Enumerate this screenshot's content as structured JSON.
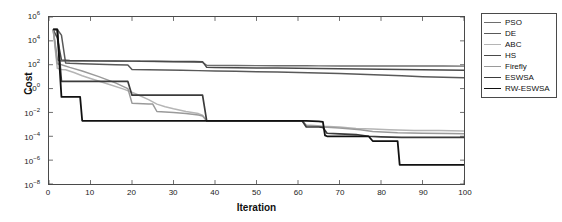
{
  "chart_data": {
    "type": "line",
    "title": "",
    "xlabel": "Iteration",
    "ylabel": "Cost",
    "xlim": [
      0,
      100
    ],
    "ylim": [
      1e-08,
      1000000.0
    ],
    "yscale": "log",
    "xscale": "linear",
    "grid": false,
    "legend_position": "top-right",
    "xticks": [
      "0",
      "10",
      "20",
      "30",
      "40",
      "50",
      "60",
      "70",
      "80",
      "90",
      "100"
    ],
    "xtick_values": [
      0,
      10,
      20,
      30,
      40,
      50,
      60,
      70,
      80,
      90,
      100
    ],
    "yticks": [
      "10−8",
      "10−6",
      "10−4",
      "10−2",
      "10⁰",
      "10²",
      "10⁴",
      "10⁶"
    ],
    "ytick_exponents": [
      -8,
      -6,
      -4,
      -2,
      0,
      2,
      4,
      6
    ],
    "series": [
      {
        "name": "PSO",
        "color": "#6e6e6e",
        "width": 1.5,
        "x": [
          1,
          2,
          3,
          4,
          5,
          8,
          12,
          16,
          20,
          21,
          22,
          26,
          30,
          34,
          37,
          38,
          40,
          45,
          50,
          55,
          60,
          62,
          65,
          70,
          75,
          80,
          85,
          90,
          95,
          100
        ],
        "y": [
          90000,
          260,
          200,
          200,
          200,
          200,
          200,
          200,
          200,
          200,
          195,
          190,
          180,
          170,
          160,
          90,
          88,
          86,
          84,
          83,
          82,
          81,
          80,
          79,
          79,
          78,
          78,
          77,
          77,
          76
        ]
      },
      {
        "name": "DE",
        "color": "#595959",
        "width": 1.5,
        "x": [
          1,
          2,
          3,
          4,
          5,
          8,
          12,
          16,
          19,
          20,
          24,
          28,
          32,
          36,
          40,
          45,
          50,
          55,
          60,
          65,
          70,
          75,
          80,
          85,
          90,
          95,
          100
        ],
        "y": [
          90000,
          90000,
          30000,
          140,
          130,
          120,
          110,
          100,
          95,
          40,
          38,
          36,
          34,
          32,
          30,
          28,
          26,
          24,
          22,
          20,
          18,
          16,
          14,
          12,
          10,
          9,
          8
        ]
      },
      {
        "name": "ABC",
        "color": "#b5b5b5",
        "width": 1.5,
        "x": [
          1,
          2,
          3,
          4,
          6,
          8,
          10,
          14,
          18,
          21,
          24,
          26,
          28,
          30,
          33,
          36,
          37,
          38,
          45,
          52,
          58,
          61,
          62,
          64,
          66,
          70,
          74,
          78,
          82,
          88,
          94,
          100
        ],
        "y": [
          90000,
          50,
          40,
          38,
          22,
          12,
          7,
          2.5,
          0.9,
          0.35,
          0.12,
          0.05,
          0.03,
          0.02,
          0.012,
          0.008,
          0.006,
          0.002,
          0.002,
          0.002,
          0.002,
          0.002,
          0.0009,
          0.0008,
          0.0007,
          0.0006,
          0.00045,
          0.0004,
          0.00035,
          0.0003,
          0.0003,
          0.00028
        ]
      },
      {
        "name": "HS",
        "color": "#4a4a4a",
        "width": 1.5,
        "x": [
          1,
          2,
          3,
          4,
          5,
          8,
          12,
          16,
          20,
          25,
          30,
          35,
          37,
          38,
          40,
          45,
          50,
          55,
          60,
          65,
          70,
          75,
          80,
          85,
          90,
          95,
          100
        ],
        "y": [
          90000,
          18000,
          250,
          240,
          230,
          220,
          210,
          205,
          200,
          195,
          190,
          185,
          180,
          60,
          58,
          56,
          54,
          52,
          50,
          48,
          46,
          44,
          42,
          40,
          38,
          36,
          34
        ]
      },
      {
        "name": "Firefly",
        "color": "#9a9a9a",
        "width": 1.5,
        "x": [
          1,
          2,
          3,
          5,
          8,
          12,
          16,
          19,
          20,
          24,
          25,
          26,
          30,
          33,
          36,
          37,
          38,
          44,
          50,
          56,
          60,
          61,
          62,
          65,
          66,
          70,
          75,
          78,
          84,
          90,
          96,
          100
        ],
        "y": [
          90000,
          120,
          100,
          60,
          30,
          10,
          3,
          1,
          0.06,
          0.05,
          0.05,
          0.012,
          0.01,
          0.008,
          0.006,
          0.005,
          0.002,
          0.002,
          0.002,
          0.002,
          0.002,
          0.002,
          0.0008,
          0.0007,
          0.0006,
          0.0005,
          0.00035,
          0.00025,
          0.0002,
          0.00018,
          0.00017,
          0.00016
        ]
      },
      {
        "name": "ESWSA",
        "color": "#3b3b3b",
        "width": 1.7,
        "x": [
          1,
          2,
          3,
          4,
          5,
          6,
          8,
          12,
          16,
          19,
          20,
          25,
          30,
          35,
          37,
          38,
          44,
          50,
          56,
          60,
          61,
          62,
          65,
          66,
          67,
          70,
          74,
          77,
          80,
          85,
          90,
          95,
          100
        ],
        "y": [
          90000,
          90000,
          4,
          4,
          4,
          4,
          4,
          4,
          4,
          4,
          0.28,
          0.28,
          0.28,
          0.28,
          0.28,
          0.002,
          0.002,
          0.002,
          0.002,
          0.002,
          0.002,
          0.0006,
          0.0006,
          0.00055,
          0.00018,
          0.00016,
          0.00014,
          0.0001,
          9e-05,
          8e-05,
          8e-05,
          8e-05,
          8e-05
        ]
      },
      {
        "name": "RW-ESWSA",
        "color": "#111111",
        "width": 1.8,
        "x": [
          1,
          2,
          3,
          4,
          5,
          6,
          7,
          7.5,
          8,
          12,
          18,
          25,
          32,
          38,
          44,
          50,
          56,
          60,
          61,
          62,
          65,
          66,
          66.5,
          67,
          70,
          74,
          77,
          78,
          80,
          84,
          84.5,
          85,
          90,
          95,
          100
        ],
        "y": [
          90000,
          90000,
          0.2,
          0.2,
          0.2,
          0.2,
          0.2,
          0.2,
          0.002,
          0.002,
          0.002,
          0.002,
          0.002,
          0.002,
          0.002,
          0.002,
          0.002,
          0.002,
          0.002,
          0.002,
          0.0018,
          0.0016,
          0.00012,
          0.0001,
          0.0001,
          0.0001,
          0.0001,
          4e-05,
          4e-05,
          4e-05,
          4e-07,
          4e-07,
          4e-07,
          4e-07,
          4e-07
        ]
      }
    ]
  },
  "legend": {
    "items": [
      {
        "label": "PSO"
      },
      {
        "label": "DE"
      },
      {
        "label": "ABC"
      },
      {
        "label": "HS"
      },
      {
        "label": "Firefly"
      },
      {
        "label": "ESWSA"
      },
      {
        "label": "RW-ESWSA"
      }
    ]
  }
}
